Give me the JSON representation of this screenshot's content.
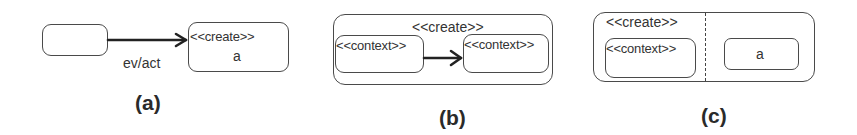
{
  "panels": [
    {
      "id": "a",
      "caption": "(a)",
      "source_state": {
        "label": ""
      },
      "transition": {
        "label": "ev/act"
      },
      "target_state": {
        "stereotype": "<<create>>",
        "name": "a"
      }
    },
    {
      "id": "b",
      "caption": "(b)",
      "outer_state": {
        "stereotype": "<<create>>"
      },
      "inner_left": {
        "stereotype": "<<context>>"
      },
      "inner_right": {
        "stereotype": "<<context>>"
      }
    },
    {
      "id": "c",
      "caption": "(c)",
      "outer_state": {
        "stereotype": "<<create>>"
      },
      "left_region_inner": {
        "stereotype": "<<context>>"
      },
      "right_region_inner": {
        "name": "a"
      }
    }
  ],
  "colors": {
    "stroke": "#4a4a4a",
    "text": "#333333",
    "background": "#ffffff"
  }
}
